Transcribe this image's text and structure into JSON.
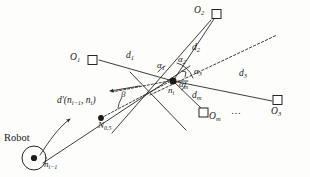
{
  "figure": {
    "type": "geometry-diagram",
    "background_color": "#fdfdfc",
    "stroke_color": "#1a1a1a"
  },
  "labels": {
    "robot": "Robot",
    "node_prev": {
      "base": "n",
      "sub": "i−1"
    },
    "node_curr": {
      "base": "n",
      "sub": "i"
    },
    "node_half": {
      "base": "N",
      "sub": "0.5"
    },
    "d_prime": "d'(n",
    "d_prime_sub1": "i−1",
    "d_prime_mid": ", n",
    "d_prime_sub2": "i",
    "d_prime_end": ")",
    "beta": "β",
    "ellipsis": "…"
  },
  "landmarks": [
    {
      "id": "O1",
      "base": "O",
      "sub": "1",
      "x": 92,
      "y": 60,
      "label_x": 78,
      "label_y": 54,
      "label_side": "left"
    },
    {
      "id": "O2",
      "base": "O",
      "sub": "2",
      "x": 216,
      "y": 14,
      "label_x": 200,
      "label_y": 8,
      "label_side": "left"
    },
    {
      "id": "Om",
      "base": "O",
      "sub": "m",
      "x": 204,
      "y": 114,
      "label_x": 211,
      "label_y": 114,
      "label_side": "right"
    },
    {
      "id": "O3",
      "base": "O",
      "sub": "3",
      "x": 278,
      "y": 100,
      "label_x": 272,
      "label_y": 110,
      "label_side": "below"
    }
  ],
  "distances": [
    {
      "id": "d1",
      "base": "d",
      "sub": "1",
      "x": 128,
      "y": 55
    },
    {
      "id": "d2",
      "base": "d",
      "sub": "2",
      "x": 193,
      "y": 47
    },
    {
      "id": "d3",
      "base": "d",
      "sub": "3",
      "x": 240,
      "y": 73
    },
    {
      "id": "dm",
      "base": "d",
      "sub": "m",
      "x": 194,
      "y": 94
    }
  ],
  "angles": [
    {
      "id": "a1",
      "base": "α",
      "sub": "1",
      "x": 159,
      "y": 64
    },
    {
      "id": "a2",
      "base": "α",
      "sub": "2",
      "x": 180,
      "y": 59
    },
    {
      "id": "a3",
      "base": "α",
      "sub": "3",
      "x": 196,
      "y": 70
    },
    {
      "id": "am",
      "base": "α",
      "sub": "m",
      "x": 181,
      "y": 83
    }
  ],
  "geometry": {
    "node_curr_point": {
      "x": 173,
      "y": 81
    },
    "node_prev_point": {
      "x": 34,
      "y": 158
    },
    "node_half_point": {
      "x": 101,
      "y": 118
    },
    "robot_circle": {
      "cx": 34,
      "cy": 158,
      "r": 12
    },
    "heading_arrow_tip": {
      "x": 72,
      "y": 117
    },
    "bearing_arrow_tip": {
      "x": 108,
      "y": 92
    },
    "dashed_ray_end": {
      "x": 277,
      "y": 35
    }
  }
}
